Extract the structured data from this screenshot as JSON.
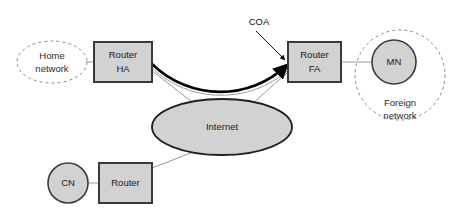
{
  "diagram": {
    "colors": {
      "node_fill": "#d2d2d2",
      "node_stroke": "#3a3a3a",
      "cloud_fill": "#d2d2d2",
      "cloud_stroke": "#1f1f1f",
      "zone_stroke": "#8a8a8a",
      "link_stroke": "#9a9a9a",
      "tunnel_stroke": "#000000",
      "background": "#ffffff",
      "text": "#1a1a1a"
    },
    "nodes": {
      "home_network": {
        "label_line1": "Home",
        "label_line2": "network"
      },
      "router_ha": {
        "label_line1": "Router",
        "label_line2": "HA"
      },
      "router_fa": {
        "label_line1": "Router",
        "label_line2": "FA"
      },
      "mobile_node": {
        "label": "MN"
      },
      "foreign_network": {
        "label_line1": "Foreign",
        "label_line2": "network"
      },
      "internet": {
        "label": "Internet"
      },
      "correspondent_node": {
        "label": "CN"
      },
      "router_cn": {
        "label": "Router"
      }
    },
    "annotations": {
      "coa": {
        "label": "COA"
      }
    },
    "edges": [
      {
        "name": "home-network-to-router-ha",
        "style": "thin"
      },
      {
        "name": "router-ha-to-internet",
        "style": "thin"
      },
      {
        "name": "router-fa-to-internet",
        "style": "thin"
      },
      {
        "name": "router-fa-to-mn",
        "style": "thin"
      },
      {
        "name": "cn-to-router",
        "style": "thin"
      },
      {
        "name": "router-cn-to-internet",
        "style": "thin"
      },
      {
        "name": "tunnel-ha-to-fa",
        "style": "thick-arrow"
      }
    ]
  }
}
